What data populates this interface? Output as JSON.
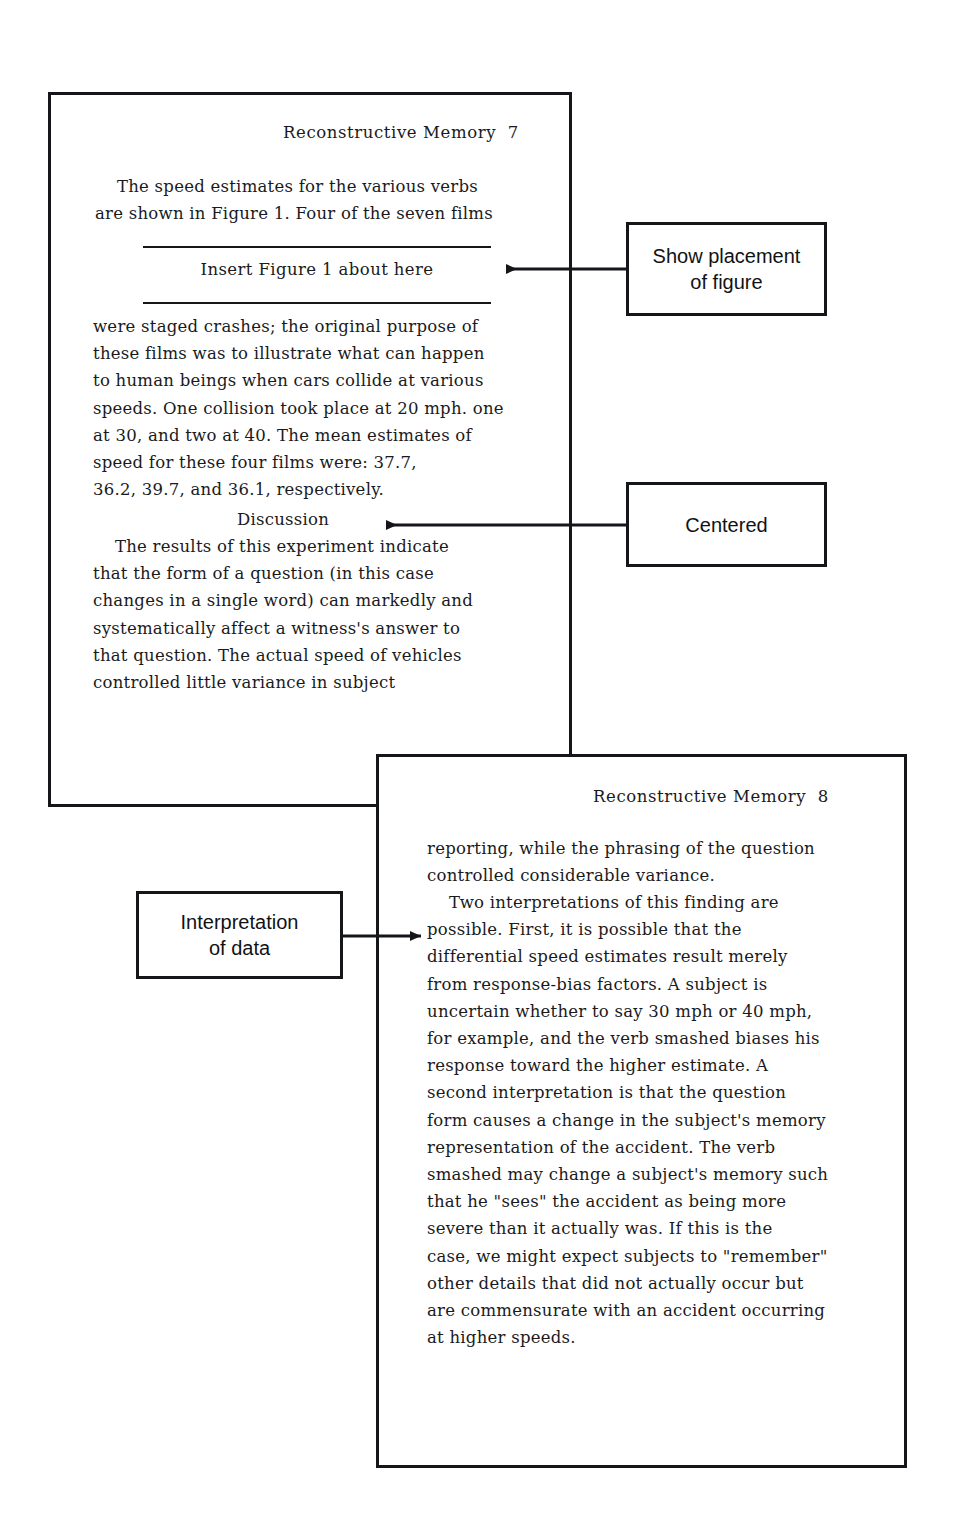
{
  "document": {
    "pages": [
      {
        "id": "page-seven",
        "header": "Reconstructive Memory  7",
        "paragraph_1": "    The speed estimates for the various verbs\nare shown in Figure 1. Four of the seven films",
        "figure_note": "Insert Figure 1 about here",
        "paragraph_2": "were staged crashes; the original purpose of\nthese films was to illustrate what can happen\nto human beings when cars collide at various\nspeeds. One collision took place at 20 mph. one\nat 30, and two at 40. The mean estimates of\nspeed for these four films were: 37.7,\n36.2, 39.7, and 36.1, respectively.",
        "section_heading": "Discussion",
        "paragraph_3": "    The results of this experiment indicate\nthat the form of a question (in this case\nchanges in a single word) can markedly and\nsystematically affect a witness's answer to\nthat question. The actual speed of vehicles\ncontrolled little variance in subject"
      },
      {
        "id": "page-eight",
        "header": "Reconstructive Memory  8",
        "paragraph_1": "reporting, while the phrasing of the question\ncontrolled considerable variance.",
        "paragraph_2": "    Two interpretations of this finding are\npossible. First, it is possible that the\ndifferential speed estimates result merely\nfrom response-bias factors. A subject is\nuncertain whether to say 30 mph or 40 mph,\nfor example, and the verb smashed biases his\nresponse toward the higher estimate. A\nsecond interpretation is that the question\nform causes a change in the subject's memory\nrepresentation of the accident. The verb\nsmashed may change a subject's memory such\nthat he \"sees\" the accident as being more\nsevere than it actually was. If this is the\ncase, we might expect subjects to \"remember\"\nother details that did not actually occur but\nare commensurate with an accident occurring\nat higher speeds."
      }
    ]
  },
  "annotations": [
    {
      "id": "show-placement",
      "label": "Show placement\nof figure",
      "arrow_direction": "left"
    },
    {
      "id": "centered",
      "label": "Centered",
      "arrow_direction": "left"
    },
    {
      "id": "interpretation",
      "label": "Interpretation\nof data",
      "arrow_direction": "right"
    }
  ],
  "colors": {
    "ink": "#1a1a1c",
    "rule": "#15161a",
    "paper": "#ffffff"
  }
}
